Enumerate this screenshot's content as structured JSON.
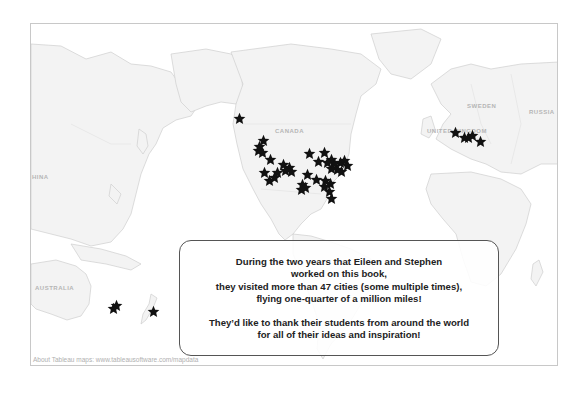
{
  "map": {
    "country_labels": [
      {
        "text": "CANADA",
        "x": 244,
        "y": 104
      },
      {
        "text": "HINA",
        "x": 1,
        "y": 150
      },
      {
        "text": "AUSTRALIA",
        "x": 4,
        "y": 261
      },
      {
        "text": "UNITED KINGDOM",
        "x": 396,
        "y": 104
      },
      {
        "text": "SWEDEN",
        "x": 436,
        "y": 79
      },
      {
        "text": "RUSSIA",
        "x": 498,
        "y": 85
      }
    ],
    "star_color": "#111111",
    "stars": [
      {
        "x": 208,
        "y": 94
      },
      {
        "x": 232,
        "y": 116
      },
      {
        "x": 228,
        "y": 122
      },
      {
        "x": 227,
        "y": 126
      },
      {
        "x": 231,
        "y": 128
      },
      {
        "x": 239,
        "y": 135
      },
      {
        "x": 233,
        "y": 148
      },
      {
        "x": 238,
        "y": 156
      },
      {
        "x": 243,
        "y": 153
      },
      {
        "x": 246,
        "y": 148
      },
      {
        "x": 252,
        "y": 140
      },
      {
        "x": 258,
        "y": 143
      },
      {
        "x": 260,
        "y": 147
      },
      {
        "x": 254,
        "y": 146
      },
      {
        "x": 278,
        "y": 129
      },
      {
        "x": 293,
        "y": 128
      },
      {
        "x": 300,
        "y": 135
      },
      {
        "x": 287,
        "y": 137
      },
      {
        "x": 303,
        "y": 139
      },
      {
        "x": 309,
        "y": 138
      },
      {
        "x": 313,
        "y": 136
      },
      {
        "x": 306,
        "y": 145
      },
      {
        "x": 300,
        "y": 144
      },
      {
        "x": 310,
        "y": 147
      },
      {
        "x": 316,
        "y": 141
      },
      {
        "x": 296,
        "y": 138
      },
      {
        "x": 285,
        "y": 155
      },
      {
        "x": 276,
        "y": 150
      },
      {
        "x": 271,
        "y": 160
      },
      {
        "x": 274,
        "y": 163
      },
      {
        "x": 270,
        "y": 165
      },
      {
        "x": 294,
        "y": 156
      },
      {
        "x": 299,
        "y": 159
      },
      {
        "x": 293,
        "y": 162
      },
      {
        "x": 298,
        "y": 167
      },
      {
        "x": 300,
        "y": 174
      },
      {
        "x": 424,
        "y": 108
      },
      {
        "x": 433,
        "y": 113
      },
      {
        "x": 441,
        "y": 111
      },
      {
        "x": 437,
        "y": 113
      },
      {
        "x": 449,
        "y": 117
      },
      {
        "x": 82,
        "y": 284
      },
      {
        "x": 85,
        "y": 281
      },
      {
        "x": 122,
        "y": 287
      }
    ]
  },
  "note": {
    "line1": "During the two years that Eileen and Stephen",
    "line2": "worked on this book,",
    "line3": "they visited more than 47 cities (some multiple times),",
    "line4": "flying one-quarter of a million miles!",
    "line5": "They’d like to thank their students from around the world",
    "line6": "for all of their ideas and inspiration!"
  },
  "attribution": "About Tableau maps: www.tableausoftware.com/mapdata"
}
